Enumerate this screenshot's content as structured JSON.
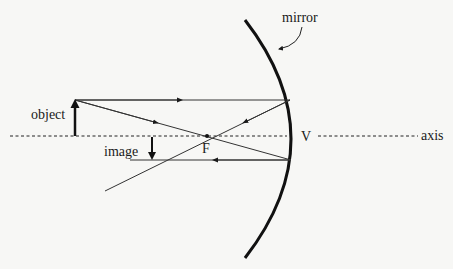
{
  "diagram": {
    "labels": {
      "mirror": "mirror",
      "object": "object",
      "image": "image",
      "focal_point": "F",
      "vertex": "V",
      "axis": "axis"
    },
    "colors": {
      "background": "#f7f7f5",
      "ink": "#1a1a1a",
      "ray": "#333333"
    },
    "elements": {
      "principal_axis": {
        "y": 136,
        "style": "dashed"
      },
      "mirror": {
        "type": "concave",
        "vertex_x": 291,
        "top": [
          245,
          20
        ],
        "bottom": [
          245,
          258
        ]
      },
      "object_arrow": {
        "x": 75,
        "base_y": 136,
        "tip_y": 100,
        "direction": "up"
      },
      "image_arrow": {
        "x": 152,
        "base_y": 136,
        "tip_y": 160,
        "direction": "down"
      },
      "focal_point": {
        "x": 207,
        "y": 136
      },
      "rays": [
        {
          "name": "parallel-incident-ray",
          "from": [
            75,
            100
          ],
          "to": [
            290,
            100
          ],
          "arrow": "right"
        },
        {
          "name": "focal-incident-ray",
          "from": [
            75,
            100
          ],
          "to": [
            291,
            160
          ],
          "arrow": "right"
        },
        {
          "name": "reflected-through-focus-ray",
          "from": [
            290,
            100
          ],
          "to": [
            105,
            191
          ],
          "arrow": "left"
        },
        {
          "name": "reflected-parallel-ray",
          "from": [
            291,
            160
          ],
          "to": [
            130,
            160
          ],
          "arrow": "left"
        }
      ]
    }
  }
}
